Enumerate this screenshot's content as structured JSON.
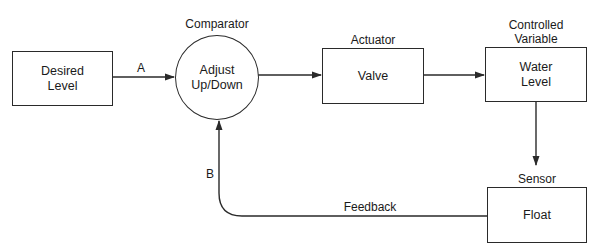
{
  "diagram": {
    "type": "feedback control loop block diagram",
    "nodes": [
      {
        "id": "desired",
        "text": "Desired\nLevel",
        "caption": ""
      },
      {
        "id": "comparator",
        "text": "Adjust\nUp/Down",
        "caption": "Comparator",
        "shape": "circle"
      },
      {
        "id": "actuator",
        "text": "Valve",
        "caption": "Actuator"
      },
      {
        "id": "controlled",
        "text": "Water\nLevel",
        "caption": "Controlled\nVariable"
      },
      {
        "id": "sensor",
        "text": "Float",
        "caption": "Sensor"
      }
    ],
    "edges": [
      {
        "from": "desired",
        "to": "comparator",
        "label": "A"
      },
      {
        "from": "comparator",
        "to": "actuator",
        "label": ""
      },
      {
        "from": "actuator",
        "to": "controlled",
        "label": ""
      },
      {
        "from": "controlled",
        "to": "sensor",
        "label": ""
      },
      {
        "from": "sensor",
        "to": "comparator",
        "label": "Feedback",
        "secondary_label": "B"
      }
    ]
  },
  "labels": {
    "desired_text": "Desired\nLevel",
    "comparator_caption": "Comparator",
    "comparator_text": "Adjust\nUp/Down",
    "actuator_caption": "Actuator",
    "actuator_text": "Valve",
    "controlled_caption": "Controlled\nVariable",
    "controlled_text": "Water\nLevel",
    "sensor_caption": "Sensor",
    "sensor_text": "Float",
    "edge_a": "A",
    "edge_b": "B",
    "feedback": "Feedback"
  },
  "colors": {
    "line": "#2a2a2a",
    "background": "#ffffff"
  }
}
